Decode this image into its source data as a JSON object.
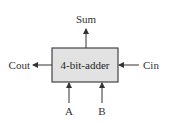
{
  "diagram": {
    "block": {
      "label": "4-bit-adder",
      "fill": "#e2e2e2",
      "stroke": "#444444"
    },
    "ports": {
      "sum": {
        "label": "Sum",
        "direction": "output"
      },
      "cout": {
        "label": "Cout",
        "direction": "output"
      },
      "cin": {
        "label": "Cin",
        "direction": "input"
      },
      "a": {
        "label": "A",
        "direction": "input"
      },
      "b": {
        "label": "B",
        "direction": "input"
      }
    },
    "colors": {
      "line": "#333333",
      "background": "#ffffff"
    }
  }
}
